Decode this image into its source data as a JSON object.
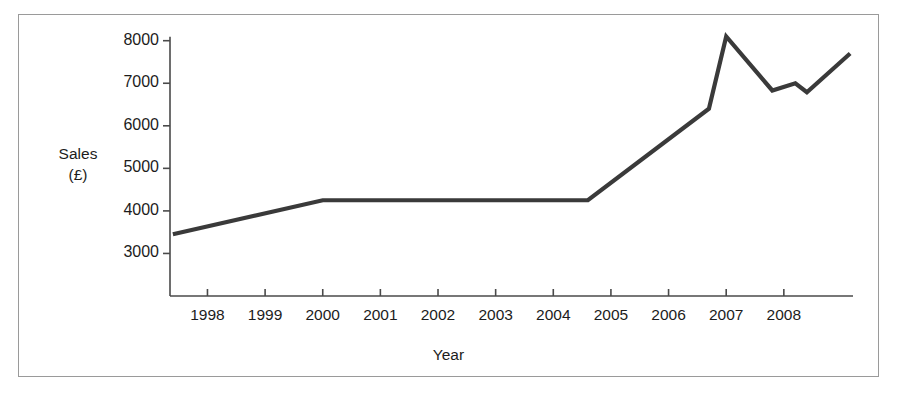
{
  "chart_data": {
    "type": "line",
    "title": "",
    "xlabel": "Year",
    "ylabel": "Sales (£)",
    "ylabel_line1": "Sales",
    "ylabel_line2": "(£)",
    "grid": false,
    "legend": false,
    "line_color": "#3a3a3a",
    "axis_color": "#4a4a4a",
    "frame_color": "#9a9a9a",
    "background": "#ffffff",
    "xlim": [
      1997.35,
      2009.2
    ],
    "ylim": [
      2000,
      8200
    ],
    "ytick_labels": [
      "8000",
      "7000",
      "6000",
      "5000",
      "4000",
      "3000"
    ],
    "ytick_values": [
      8000,
      7000,
      6000,
      5000,
      4000,
      3000
    ],
    "xtick_labels": [
      "1998",
      "1999",
      "2000",
      "2001",
      "2002",
      "2003",
      "2004",
      "2005",
      "2006",
      "2007",
      "2008"
    ],
    "xtick_values": [
      1998,
      1999,
      2000,
      2001,
      2002,
      2003,
      2004,
      2005,
      2006,
      2007,
      2008
    ],
    "x": [
      1997.4,
      2000.0,
      2004.6,
      2006.7,
      2007.0,
      2007.8,
      2008.2,
      2008.4,
      2009.15
    ],
    "y": [
      3450,
      4250,
      4250,
      6400,
      8100,
      6830,
      7000,
      6790,
      7700
    ],
    "series": [
      {
        "name": "Sales",
        "points": [
          {
            "x": 1997.4,
            "y": 3450
          },
          {
            "x": 2000.0,
            "y": 4250
          },
          {
            "x": 2004.6,
            "y": 4250
          },
          {
            "x": 2006.7,
            "y": 6400
          },
          {
            "x": 2007.0,
            "y": 8100
          },
          {
            "x": 2007.8,
            "y": 6830
          },
          {
            "x": 2008.2,
            "y": 7000
          },
          {
            "x": 2008.4,
            "y": 6790
          },
          {
            "x": 2009.15,
            "y": 7700
          }
        ]
      }
    ]
  },
  "caption": {
    "partial_text": ""
  }
}
